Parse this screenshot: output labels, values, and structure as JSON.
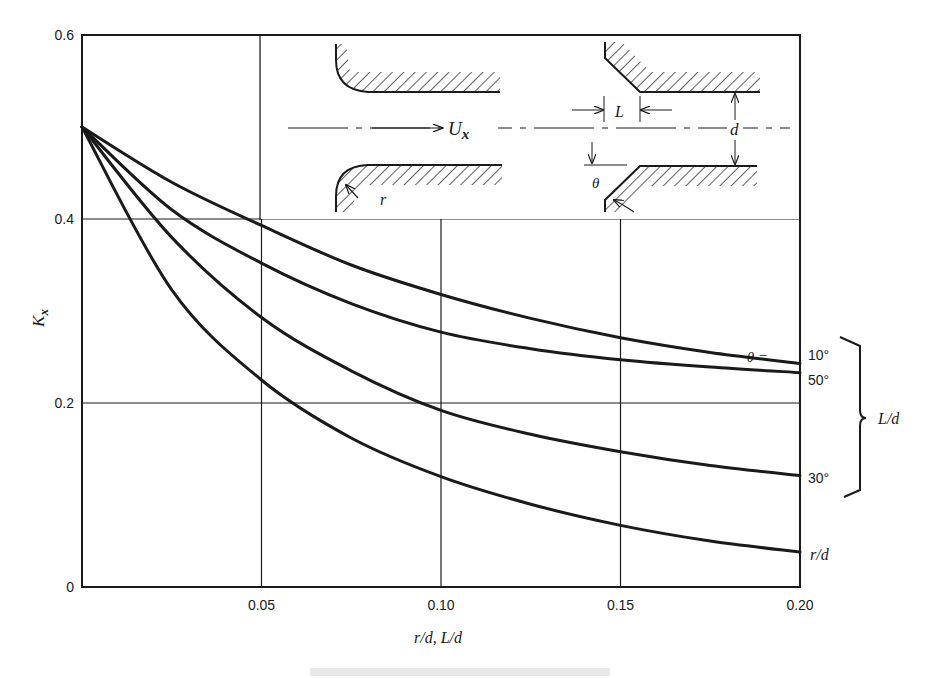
{
  "chart_data": {
    "type": "line",
    "title": "",
    "xlabel": "r/d, L/d",
    "ylabel": "K_x",
    "xlim": [
      0,
      0.2
    ],
    "ylim": [
      0,
      0.6
    ],
    "grid": true,
    "x_ticks": [
      "0.05",
      "0.10",
      "0.15",
      "0.20"
    ],
    "y_ticks": [
      "0",
      "0.2",
      "0.4",
      "0.6"
    ],
    "x": [
      0,
      0.025,
      0.05,
      0.075,
      0.1,
      0.125,
      0.15,
      0.175,
      0.2
    ],
    "series": [
      {
        "name": "θ = 10° (L/d)",
        "label": "10°",
        "values": [
          0.5,
          0.44,
          0.393,
          0.35,
          0.318,
          0.292,
          0.271,
          0.255,
          0.243
        ]
      },
      {
        "name": "θ = 50° (L/d)",
        "label": "50°",
        "values": [
          0.5,
          0.41,
          0.352,
          0.308,
          0.277,
          0.259,
          0.247,
          0.239,
          0.233
        ]
      },
      {
        "name": "θ = 30° (L/d)",
        "label": "30°",
        "values": [
          0.5,
          0.38,
          0.293,
          0.235,
          0.192,
          0.166,
          0.147,
          0.132,
          0.121
        ]
      },
      {
        "name": "r/d",
        "label": "r/d",
        "values": [
          0.5,
          0.323,
          0.225,
          0.162,
          0.12,
          0.09,
          0.067,
          0.05,
          0.038
        ]
      }
    ],
    "annotations": {
      "theta_prefix": "θ =",
      "bracket_label": "L/d",
      "bracket_covers": [
        "10°",
        "50°",
        "30°"
      ]
    },
    "legend_position": "right (inline curve labels)"
  },
  "inset": {
    "velocity_label": "U",
    "velocity_sub": "x",
    "radius_label": "r",
    "length_label": "L",
    "diameter_label": "d",
    "angle_label": "θ"
  },
  "axes": {
    "y_label_main": "K",
    "y_label_sub": "x",
    "x_label": "r/d, L/d"
  }
}
